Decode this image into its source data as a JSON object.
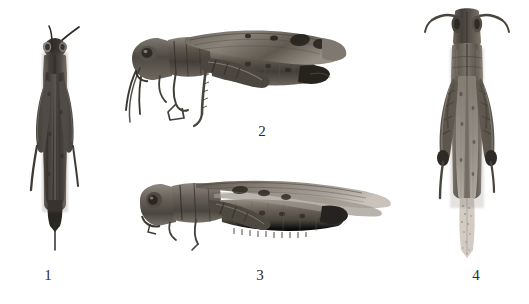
{
  "figure": {
    "kind": "scientific-plate",
    "background_color": "#ffffff",
    "width": 529,
    "height": 304,
    "medium": "grayscale photograph",
    "label_color": "#2a2a2a",
    "specimens": [
      {
        "id": "specimen-1",
        "label": "1",
        "view": "dorsal",
        "orientation": "vertical, head up",
        "tone": "dark",
        "body_color": "#3a3733",
        "shadow_color": "#6d6862",
        "highlight_color": "#9a948c",
        "x": 22,
        "y": 22,
        "w": 62,
        "h": 230,
        "label_x": 36,
        "label_y": 268
      },
      {
        "id": "specimen-2",
        "label": "2",
        "view": "lateral",
        "orientation": "horizontal, head to the left",
        "tone": "medium-dark",
        "body_color": "#4a4641",
        "shadow_color": "#76706a",
        "highlight_color": "#a8a29a",
        "x": 124,
        "y": 16,
        "w": 230,
        "h": 118,
        "label_x": 250,
        "label_y": 124
      },
      {
        "id": "specimen-3",
        "label": "3",
        "view": "lateral",
        "orientation": "horizontal, head to the left, long wings",
        "tone": "medium",
        "body_color": "#55504a",
        "shadow_color": "#837c74",
        "highlight_color": "#b4ada4",
        "x": 138,
        "y": 180,
        "w": 255,
        "h": 78,
        "label_x": 248,
        "label_y": 268
      },
      {
        "id": "specimen-4",
        "label": "4",
        "view": "dorsal",
        "orientation": "vertical, head up, antennae spread",
        "tone": "light-medium",
        "body_color": "#5c574f",
        "shadow_color": "#8b8479",
        "highlight_color": "#bdb6ac",
        "x": 424,
        "y": 4,
        "w": 84,
        "h": 258,
        "label_x": 464,
        "label_y": 268
      }
    ]
  }
}
